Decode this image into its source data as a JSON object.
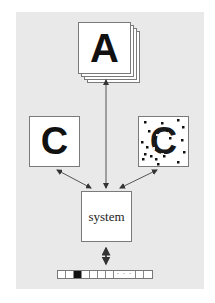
{
  "diagram": {
    "background_color": "#e9e9e9",
    "top_stack": {
      "glyph": "A",
      "layers": 4,
      "description": "stack of clean character images"
    },
    "left_box": {
      "glyph": "C",
      "variant": "clean"
    },
    "right_box": {
      "glyph": "C",
      "variant": "noisy"
    },
    "center_box": {
      "label": "system"
    },
    "tape": {
      "cells": [
        "empty",
        "filled",
        "empty",
        "empty",
        "empty",
        "empty",
        "dots",
        "empty",
        "empty"
      ],
      "ellipsis": "· · ·"
    },
    "arrows": [
      {
        "from": "top_stack",
        "to": "center_box",
        "type": "double"
      },
      {
        "from": "left_box",
        "to": "center_box",
        "type": "double"
      },
      {
        "from": "right_box",
        "to": "center_box",
        "type": "double"
      },
      {
        "from": "center_box",
        "to": "tape",
        "type": "double"
      }
    ]
  }
}
